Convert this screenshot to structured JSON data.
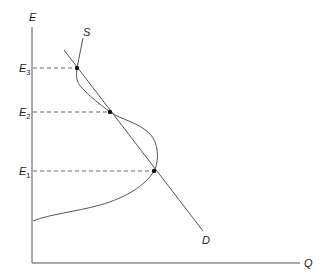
{
  "diagram": {
    "type": "supply-demand with backward-bending supply curve",
    "axes": {
      "y_label": "E",
      "x_label": "Q"
    },
    "curves": {
      "supply_label": "S",
      "demand_label": "D"
    },
    "equilibria": [
      {
        "base": "E",
        "sub": "3"
      },
      {
        "base": "E",
        "sub": "2"
      },
      {
        "base": "E",
        "sub": "1"
      }
    ],
    "colors": {
      "line": "#555555",
      "dot": "#111111",
      "text": "#222222"
    }
  }
}
